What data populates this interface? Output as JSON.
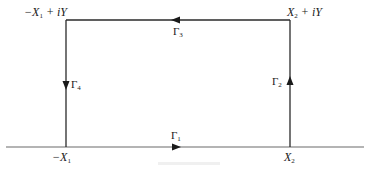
{
  "diagram": {
    "corners": {
      "top_left": {
        "prefix": "−X",
        "sub": "1",
        "suffix": " + iY"
      },
      "top_right": {
        "prefix": "X",
        "sub": "2",
        "suffix": " + iY"
      },
      "bottom_left": {
        "prefix": "−X",
        "sub": "1",
        "suffix": ""
      },
      "bottom_right": {
        "prefix": "X",
        "sub": "2",
        "suffix": ""
      }
    },
    "segments": [
      {
        "id": "gamma1",
        "symbol": "Γ",
        "sub": "1",
        "side": "bottom",
        "direction": "right"
      },
      {
        "id": "gamma2",
        "symbol": "Γ",
        "sub": "2",
        "side": "right",
        "direction": "up"
      },
      {
        "id": "gamma3",
        "symbol": "Γ",
        "sub": "3",
        "side": "top",
        "direction": "left"
      },
      {
        "id": "gamma4",
        "symbol": "Γ",
        "sub": "4",
        "side": "left",
        "direction": "down"
      }
    ],
    "colors": {
      "line": "#2a2a2a",
      "axis": "#6a6a6a",
      "background": "#ffffff"
    }
  }
}
